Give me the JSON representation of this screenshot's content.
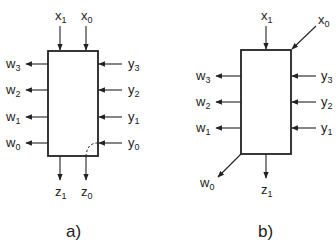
{
  "diagrams": [
    {
      "caption": "a)",
      "inputs_top": [
        {
          "base": "x",
          "sub": "1"
        },
        {
          "base": "x",
          "sub": "0"
        }
      ],
      "inputs_right": [
        {
          "base": "y",
          "sub": "3"
        },
        {
          "base": "y",
          "sub": "2"
        },
        {
          "base": "y",
          "sub": "1"
        },
        {
          "base": "y",
          "sub": "0"
        }
      ],
      "outputs_left": [
        {
          "base": "w",
          "sub": "3"
        },
        {
          "base": "w",
          "sub": "2"
        },
        {
          "base": "w",
          "sub": "1"
        },
        {
          "base": "w",
          "sub": "0"
        }
      ],
      "outputs_bottom": [
        {
          "base": "z",
          "sub": "1"
        },
        {
          "base": "z",
          "sub": "0"
        }
      ],
      "note": "dashed curve inside box connects y0 to z0"
    },
    {
      "caption": "b)",
      "inputs_top": [
        {
          "base": "x",
          "sub": "1"
        }
      ],
      "input_corner": {
        "base": "x",
        "sub": "0"
      },
      "inputs_right": [
        {
          "base": "y",
          "sub": "3"
        },
        {
          "base": "y",
          "sub": "2"
        },
        {
          "base": "y",
          "sub": "1"
        }
      ],
      "outputs_left": [
        {
          "base": "w",
          "sub": "3"
        },
        {
          "base": "w",
          "sub": "2"
        },
        {
          "base": "w",
          "sub": "1"
        }
      ],
      "output_corner": {
        "base": "w",
        "sub": "0"
      },
      "outputs_bottom": [
        {
          "base": "z",
          "sub": "1"
        }
      ]
    }
  ]
}
